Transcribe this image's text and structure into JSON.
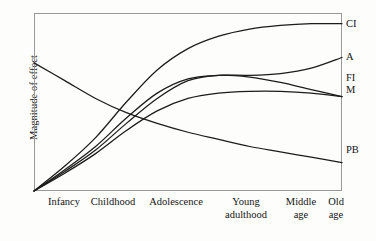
{
  "chart_data": {
    "type": "line",
    "title": "",
    "subtitle": "",
    "xlabel": "",
    "ylabel": "Magnitude of effect",
    "grid": false,
    "legend_position": "right-of-plot-end-labels",
    "axis_ticks_shown": false,
    "xlim_categories": [
      "Infancy",
      "Childhood",
      "Adolescence",
      "Young adulthood",
      "Middle age",
      "Old age"
    ],
    "ylim": [
      0,
      100
    ],
    "x": [
      0,
      10,
      20,
      30,
      40,
      50,
      60,
      70,
      80,
      90,
      100
    ],
    "series": [
      {
        "name": "CI",
        "label": "CI",
        "description": "Crystallized intelligence - rises steeply through adolescence then plateaus near the top",
        "values": [
          0,
          14,
          30,
          50,
          68,
          80,
          87,
          91,
          93,
          94,
          94
        ]
      },
      {
        "name": "A",
        "label": "A",
        "description": "Accumulated knowledge - rises through adolescence, dips slightly, then rises again in later life",
        "values": [
          0,
          12,
          25,
          41,
          55,
          63,
          65,
          65,
          66,
          69,
          75
        ]
      },
      {
        "name": "FI",
        "label": "FI",
        "description": "Fluid intelligence - peaks in early adulthood then gradually declines",
        "values": [
          0,
          11,
          23,
          38,
          52,
          62,
          65,
          64,
          61,
          57,
          53
        ]
      },
      {
        "name": "M",
        "label": "M",
        "description": "Memory - rises to a plateau in adolescence and stays roughly flat",
        "values": [
          0,
          10,
          21,
          34,
          45,
          52,
          55,
          56,
          56,
          55,
          53
        ]
      },
      {
        "name": "PB",
        "label": "PB",
        "description": "Plasticity of the brain - starts high in infancy and declines steadily across the lifespan",
        "values": [
          72,
          62,
          52,
          44,
          38,
          33,
          29,
          25,
          22,
          19,
          16
        ]
      }
    ],
    "ascending_origin": "All ascending series originate at zero at the far left (infancy)",
    "colors": {
      "line": "#1b1b1b",
      "frame": "#9a9a9a",
      "background": "#fdfdfb",
      "text": "#141414"
    }
  },
  "axis": {
    "y_title": "Magnitude of effect",
    "x_ticks": [
      {
        "line1": "Infancy",
        "line2": "",
        "x": 64
      },
      {
        "line1": "Childhood",
        "line2": "",
        "x": 113
      },
      {
        "line1": "Adolescence",
        "line2": "",
        "x": 176
      },
      {
        "line1": "Young",
        "line2": "adulthood",
        "x": 246
      },
      {
        "line1": "Middle",
        "line2": "age",
        "x": 301
      },
      {
        "line1": "Old",
        "line2": "age",
        "x": 336
      }
    ]
  },
  "series_labels": [
    {
      "text": "CI",
      "y": 19
    },
    {
      "text": "A",
      "y": 52
    },
    {
      "text": "FI",
      "y": 73
    },
    {
      "text": "M",
      "y": 85
    },
    {
      "text": "PB",
      "y": 145
    }
  ]
}
